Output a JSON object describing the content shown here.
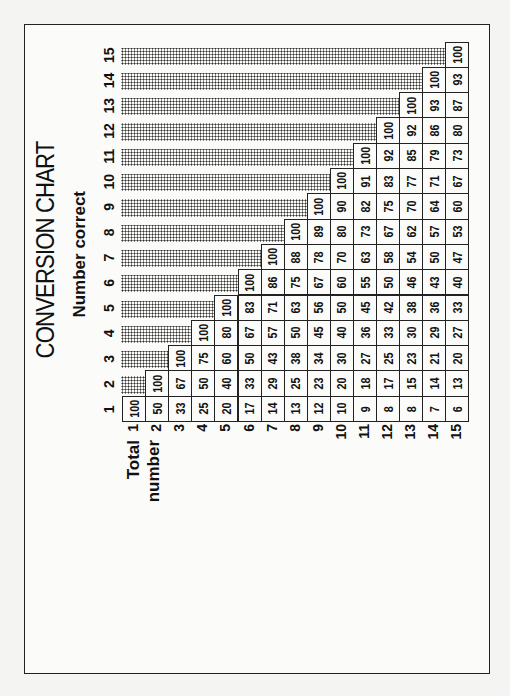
{
  "title": "CONVERSION CHART",
  "column_axis_label": "Number correct",
  "row_axis_label_line1": "Total",
  "row_axis_label_line2": "number",
  "chart_data": {
    "type": "table",
    "title": "CONVERSION CHART",
    "column_header": "Number correct",
    "row_header": "Total number",
    "columns": [
      1,
      2,
      3,
      4,
      5,
      6,
      7,
      8,
      9,
      10,
      11,
      12,
      13,
      14,
      15
    ],
    "rows": [
      1,
      2,
      3,
      4,
      5,
      6,
      7,
      8,
      9,
      10,
      11,
      12,
      13,
      14,
      15
    ],
    "values": [
      [
        100
      ],
      [
        50,
        100
      ],
      [
        33,
        67,
        100
      ],
      [
        25,
        50,
        75,
        100
      ],
      [
        20,
        40,
        60,
        80,
        100
      ],
      [
        17,
        33,
        50,
        67,
        83,
        100
      ],
      [
        14,
        29,
        43,
        57,
        71,
        86,
        100
      ],
      [
        13,
        25,
        38,
        50,
        63,
        75,
        88,
        100
      ],
      [
        12,
        23,
        34,
        45,
        56,
        67,
        78,
        89,
        100
      ],
      [
        10,
        20,
        30,
        40,
        50,
        60,
        70,
        80,
        90,
        100
      ],
      [
        9,
        18,
        27,
        36,
        45,
        55,
        63,
        73,
        82,
        91,
        100
      ],
      [
        8,
        17,
        25,
        33,
        42,
        50,
        58,
        67,
        75,
        83,
        92,
        100
      ],
      [
        8,
        15,
        23,
        30,
        38,
        46,
        54,
        62,
        70,
        77,
        85,
        92,
        100
      ],
      [
        7,
        14,
        21,
        29,
        36,
        43,
        50,
        57,
        64,
        71,
        79,
        86,
        93,
        100
      ],
      [
        6,
        13,
        20,
        27,
        33,
        40,
        47,
        53,
        60,
        67,
        73,
        80,
        87,
        93,
        100
      ]
    ],
    "note": "Cells above the diagonal are shaded (not applicable)."
  }
}
